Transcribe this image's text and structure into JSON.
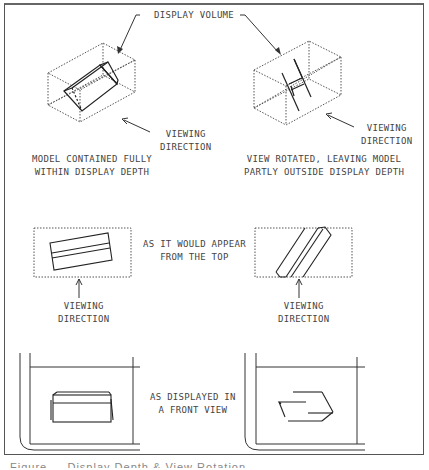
{
  "top": {
    "display_volume_label": "DISPLAY VOLUME",
    "left": {
      "viewing_label": "VIEWING\nDIRECTION",
      "caption": "MODEL CONTAINED FULLY\nWITHIN DISPLAY DEPTH"
    },
    "right": {
      "viewing_label": "VIEWING\nDIRECTION",
      "caption": "VIEW ROTATED, LEAVING MODEL\nPARTLY OUTSIDE DISPLAY DEPTH"
    }
  },
  "middle": {
    "center_label": "AS IT WOULD APPEAR\nFROM THE TOP",
    "left_viewing_label": "VIEWING\nDIRECTION",
    "right_viewing_label": "VIEWING\nDIRECTION"
  },
  "bottom": {
    "center_label": "AS DISPLAYED IN\nA FRONT VIEW"
  },
  "figure_caption": "Figure ...  Display Depth & View Rotation",
  "colors": {
    "line": "#333333",
    "dotted": "#555555",
    "text": "#444444",
    "frame": "#555555"
  }
}
